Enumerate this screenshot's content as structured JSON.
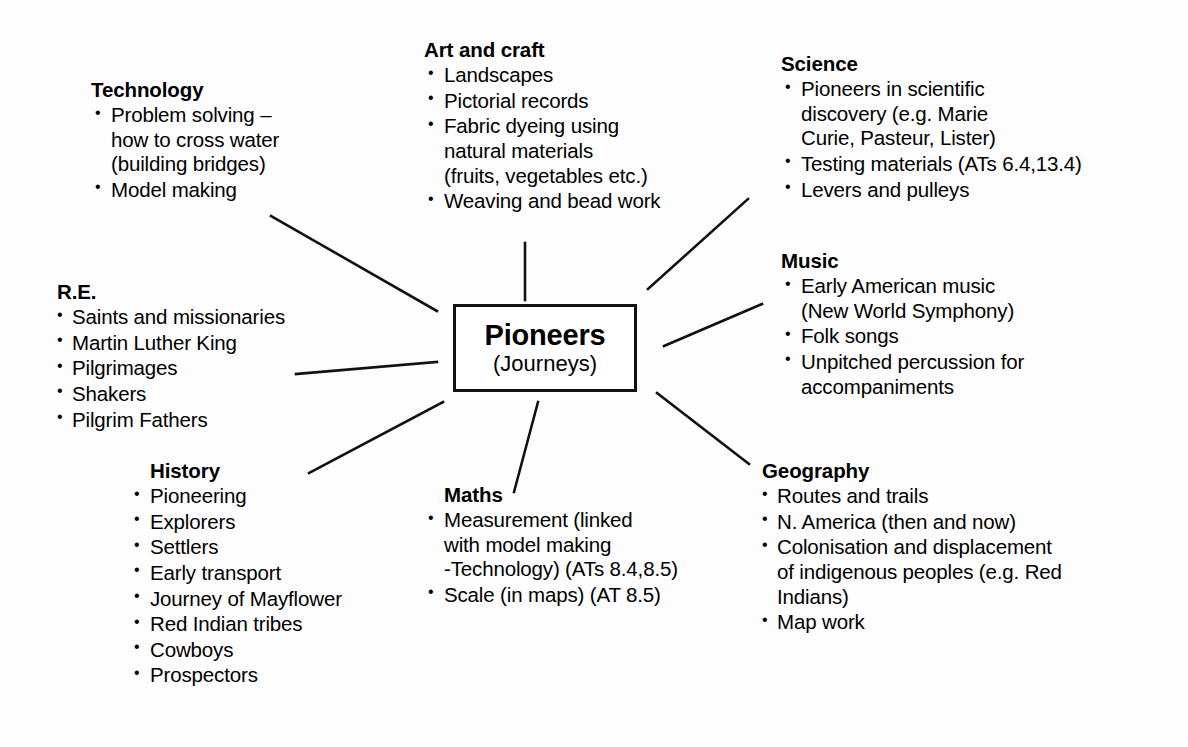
{
  "diagram": {
    "type": "mind-map",
    "center": {
      "title": "Pioneers",
      "subtitle": "(Journeys)"
    },
    "subjects": [
      {
        "id": "technology",
        "heading": "Technology",
        "items": [
          {
            "lines": [
              "Problem solving –",
              "how to cross water",
              "(building bridges)"
            ]
          },
          {
            "lines": [
              "Model making"
            ]
          }
        ]
      },
      {
        "id": "art",
        "heading": "Art and craft",
        "items": [
          {
            "lines": [
              "Landscapes"
            ]
          },
          {
            "lines": [
              "Pictorial records"
            ]
          },
          {
            "lines": [
              "Fabric dyeing using",
              "natural materials",
              "(fruits, vegetables etc.)"
            ]
          },
          {
            "lines": [
              "Weaving and bead work"
            ]
          }
        ]
      },
      {
        "id": "science",
        "heading": "Science",
        "items": [
          {
            "lines": [
              "Pioneers in scientific",
              "discovery (e.g. Marie",
              "Curie, Pasteur, Lister)"
            ]
          },
          {
            "lines": [
              "Testing materials (ATs 6.4,13.4)"
            ]
          },
          {
            "lines": [
              "Levers and pulleys"
            ]
          }
        ]
      },
      {
        "id": "music",
        "heading": "Music",
        "items": [
          {
            "lines": [
              "Early American music",
              "(New World Symphony)"
            ]
          },
          {
            "lines": [
              "Folk songs"
            ]
          },
          {
            "lines": [
              "Unpitched percussion for",
              "accompaniments"
            ]
          }
        ]
      },
      {
        "id": "re",
        "heading": "R.E.",
        "items": [
          {
            "lines": [
              "Saints and missionaries"
            ]
          },
          {
            "lines": [
              "Martin Luther King"
            ]
          },
          {
            "lines": [
              "Pilgrimages"
            ]
          },
          {
            "lines": [
              "Shakers"
            ]
          },
          {
            "lines": [
              "Pilgrim Fathers"
            ]
          }
        ]
      },
      {
        "id": "history",
        "heading": "History",
        "items": [
          {
            "lines": [
              "Pioneering"
            ]
          },
          {
            "lines": [
              "Explorers"
            ]
          },
          {
            "lines": [
              "Settlers"
            ]
          },
          {
            "lines": [
              "Early transport"
            ]
          },
          {
            "lines": [
              "Journey of Mayflower"
            ]
          },
          {
            "lines": [
              "Red Indian tribes"
            ]
          },
          {
            "lines": [
              "Cowboys"
            ]
          },
          {
            "lines": [
              "Prospectors"
            ]
          }
        ]
      },
      {
        "id": "maths",
        "heading": "Maths",
        "items": [
          {
            "lines": [
              "Measurement (linked",
              "with model making",
              "-Technology) (ATs 8.4,8.5)"
            ]
          },
          {
            "lines": [
              "Scale (in maps) (AT 8.5)"
            ]
          }
        ]
      },
      {
        "id": "geography",
        "heading": "Geography",
        "items": [
          {
            "lines": [
              "Routes and trails"
            ]
          },
          {
            "lines": [
              "N. America (then and now)"
            ]
          },
          {
            "lines": [
              "Colonisation and displacement",
              "of indigenous peoples (e.g. Red",
              "Indians)"
            ]
          },
          {
            "lines": [
              "Map work"
            ]
          }
        ]
      }
    ],
    "connectors": [
      {
        "id": "connector-technology",
        "from": "center",
        "to": "technology",
        "x1": 437,
        "y1": 311,
        "x2": 271,
        "y2": 216
      },
      {
        "id": "connector-art",
        "from": "center",
        "to": "art",
        "x1": 525,
        "y1": 300,
        "x2": 525,
        "y2": 243
      },
      {
        "id": "connector-science",
        "from": "center",
        "to": "science",
        "x1": 648,
        "y1": 289,
        "x2": 748,
        "y2": 199
      },
      {
        "id": "connector-music",
        "from": "center",
        "to": "music",
        "x1": 664,
        "y1": 346,
        "x2": 762,
        "y2": 304
      },
      {
        "id": "connector-re",
        "from": "center",
        "to": "re",
        "x1": 437,
        "y1": 362,
        "x2": 296,
        "y2": 374
      },
      {
        "id": "connector-geography",
        "from": "center",
        "to": "geography",
        "x1": 657,
        "y1": 393,
        "x2": 749,
        "y2": 464
      },
      {
        "id": "connector-maths",
        "from": "center",
        "to": "maths",
        "x1": 538,
        "y1": 402,
        "x2": 514,
        "y2": 492
      },
      {
        "id": "connector-history",
        "from": "center",
        "to": "history",
        "x1": 443,
        "y1": 402,
        "x2": 309,
        "y2": 473
      }
    ],
    "colors": {
      "ink": "#111111",
      "background": "#fdfdfd"
    }
  }
}
